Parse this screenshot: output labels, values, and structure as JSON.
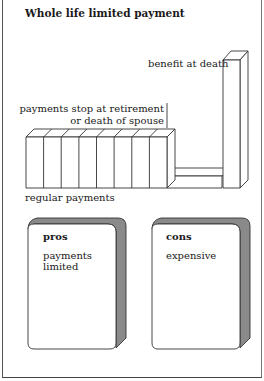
{
  "title": "Whole life limited payment",
  "diagram": {
    "labels": {
      "benefit": "benefit at death",
      "stop_line1": "payments stop at retirement",
      "stop_line2": "or death of spouse",
      "regular": "regular payments"
    },
    "payment_blocks": 8,
    "colors": {
      "line": "#333333",
      "shade": "#8a8a8a",
      "fill": "#ffffff"
    }
  },
  "cards": [
    {
      "heading": "pros",
      "body_line1": "payments",
      "body_line2": "limited"
    },
    {
      "heading": "cons",
      "body_line1": "expensive",
      "body_line2": ""
    }
  ]
}
